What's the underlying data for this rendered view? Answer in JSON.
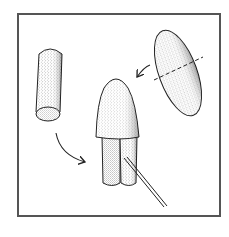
{
  "illustration": {
    "description": "Craft assembly diagram: a cylinder and a split oval piece combine into a bullet-shaped figure with two legs and a stick",
    "colors": {
      "frame": "#555555",
      "outline": "#222222",
      "stipple": "#333333",
      "background": "#ffffff"
    },
    "parts": [
      {
        "name": "cylinder",
        "position": "left"
      },
      {
        "name": "oval",
        "position": "top-right",
        "cut_line": "dashed"
      },
      {
        "name": "assembled-figure",
        "position": "center"
      },
      {
        "name": "stick",
        "position": "bottom-center"
      }
    ],
    "arrows": [
      {
        "from": "cylinder",
        "to": "assembled-figure"
      },
      {
        "from": "oval",
        "to": "assembled-figure"
      }
    ]
  }
}
